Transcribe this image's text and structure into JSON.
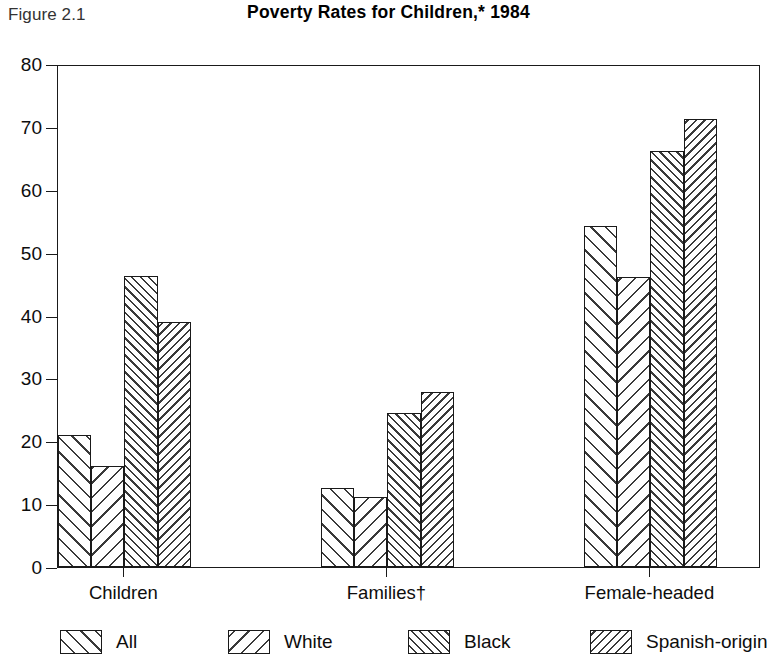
{
  "figure": {
    "label": "Figure 2.1",
    "title": "Poverty Rates for Children,* 1984"
  },
  "chart_data": {
    "type": "bar",
    "title": "Poverty Rates for Children,* 1984",
    "xlabel": "",
    "ylabel": "",
    "ylim": [
      0,
      80
    ],
    "yticks": [
      0,
      10,
      20,
      30,
      40,
      50,
      60,
      70,
      80
    ],
    "ytick_labels": [
      "0",
      "10",
      "20",
      "30",
      "40",
      "50",
      "60",
      "70",
      "80"
    ],
    "grid": false,
    "legend_position": "bottom",
    "categories": [
      "Children",
      "Families†",
      "Female-headed"
    ],
    "series": [
      {
        "name": "All",
        "hatch": "hatch-fwd-sparse",
        "values": [
          21.0,
          12.5,
          54.2
        ]
      },
      {
        "name": "White",
        "hatch": "hatch-back-sparse",
        "values": [
          16.1,
          11.2,
          46.1
        ]
      },
      {
        "name": "Black",
        "hatch": "hatch-fwd-dense",
        "values": [
          46.3,
          24.5,
          66.2
        ]
      },
      {
        "name": "Spanish-origin",
        "hatch": "hatch-back-dense",
        "values": [
          38.9,
          27.8,
          71.2
        ]
      }
    ]
  },
  "colors": {
    "axis": "#1a1a1a",
    "hatch": "#3a3a3a",
    "background": "#ffffff",
    "text": "#0d0d0d"
  }
}
